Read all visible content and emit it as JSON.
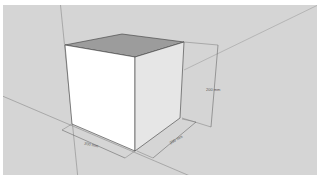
{
  "app": "3D modeling viewport",
  "scene": {
    "object": "cube",
    "dimensions": {
      "height_label": "200 mm",
      "width_label": "200 mm",
      "depth_label": "200 mm"
    }
  },
  "colors": {
    "background": "#d5d5d5",
    "front_face": "#ffffff",
    "side_face": "#e6e6e6",
    "top_face": "#9c9c9c",
    "edge": "#3a3a3a",
    "axis": "#8a8a8a",
    "dimension_line": "#555555"
  }
}
